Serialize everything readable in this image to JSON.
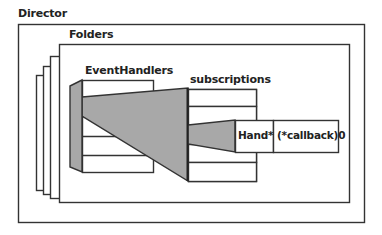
{
  "diagram": {
    "labels": {
      "director": "Director",
      "folders": "Folders",
      "event_handlers": "EventHandlers",
      "subscriptions": "subscriptions"
    },
    "entry": {
      "hand": "Hand*",
      "callback": "(*callback)0"
    },
    "colors": {
      "stroke": "#333333",
      "fill_gray": "#a8a8a8",
      "background": "#ffffff"
    }
  }
}
